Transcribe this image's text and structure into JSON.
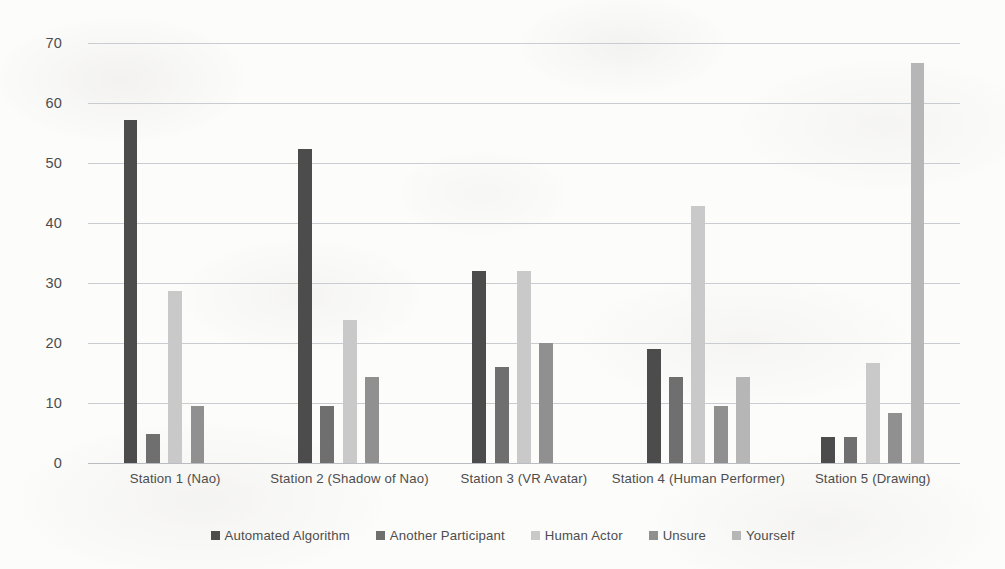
{
  "chart_data": {
    "type": "bar",
    "title": "",
    "subtitle": "",
    "xlabel": "",
    "ylabel": "",
    "ylim": [
      0,
      70
    ],
    "ytick_step": 10,
    "ytick_labels": [
      "70",
      "60",
      "50",
      "40",
      "30",
      "20",
      "10",
      "0"
    ],
    "ytick_values": [
      70,
      60,
      50,
      40,
      30,
      20,
      10,
      0
    ],
    "grid": true,
    "grid_axis": "y",
    "legend_position": "bottom",
    "grouping": "grouped",
    "categories": [
      "Station 1 (Nao)",
      "Station 2 (Shadow of Nao)",
      "Station 3 (VR Avatar)",
      "Station 4 (Human Performer)",
      "Station 5 (Drawing)"
    ],
    "series": [
      {
        "name": "Automated Algorithm",
        "color": "#4c4c4c",
        "values": [
          57.1,
          52.4,
          32.0,
          19.0,
          4.3
        ]
      },
      {
        "name": "Another Participant",
        "color": "#6f6f6f",
        "values": [
          4.8,
          9.5,
          16.0,
          14.3,
          4.3
        ]
      },
      {
        "name": "Human Actor",
        "color": "#c9c9c9",
        "values": [
          28.6,
          23.8,
          32.0,
          42.9,
          16.7
        ]
      },
      {
        "name": "Unsure",
        "color": "#909090",
        "values": [
          9.5,
          14.3,
          20.0,
          9.5,
          8.3
        ]
      },
      {
        "name": "Yourself",
        "color": "#b6b6b6",
        "values": [
          0,
          0,
          0,
          14.3,
          66.7
        ]
      }
    ]
  },
  "axis": {
    "gridline_color": "#c9cdd2",
    "tick_text_color": "#4d4d4d"
  },
  "legend": {
    "items": [
      {
        "label": "Automated Algorithm",
        "color": "#4c4c4c"
      },
      {
        "label": "Another Participant",
        "color": "#6f6f6f"
      },
      {
        "label": "Human Actor",
        "color": "#c9c9c9"
      },
      {
        "label": "Unsure",
        "color": "#909090"
      },
      {
        "label": "Yourself",
        "color": "#b6b6b6"
      }
    ]
  }
}
